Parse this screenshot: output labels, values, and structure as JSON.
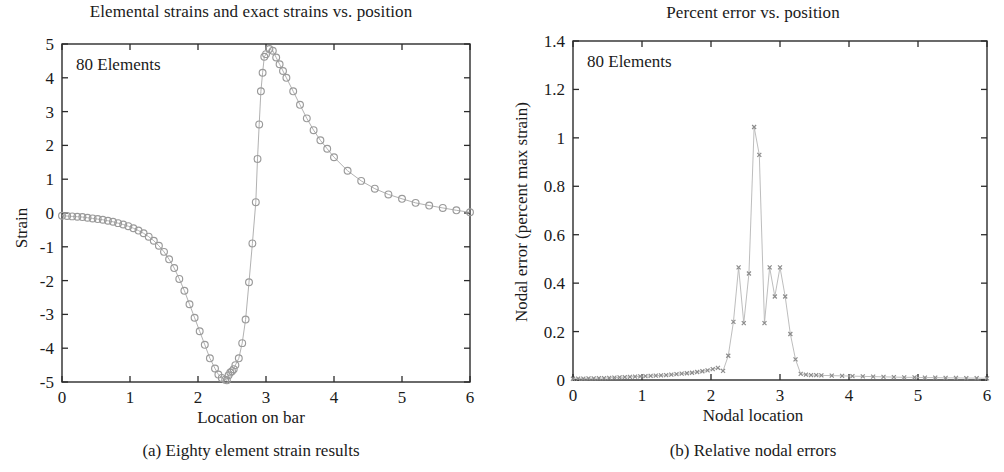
{
  "figure": {
    "panels": [
      {
        "id": "panel-a",
        "title": "Elemental strains and exact strains vs. position",
        "annotation": "80 Elements",
        "xlabel": "Location on bar",
        "ylabel": "Strain",
        "subcaption": "(a) Eighty element strain results"
      },
      {
        "id": "panel-b",
        "title": "Percent error vs. position",
        "annotation": "80 Elements",
        "xlabel": "Nodal location",
        "ylabel": "Nodal error (percent max strain)",
        "subcaption": "(b) Relative nodal errors"
      }
    ]
  },
  "chart_data": [
    {
      "type": "line",
      "title": "Elemental strains and exact strains vs. position",
      "annotation": "80 Elements",
      "xlabel": "Location on bar",
      "ylabel": "Strain",
      "xlim": [
        0,
        6
      ],
      "ylim": [
        -5,
        5
      ],
      "xticks": [
        0,
        1,
        2,
        3,
        4,
        5,
        6
      ],
      "yticks": [
        -5,
        -4,
        -3,
        -2,
        -1,
        0,
        1,
        2,
        3,
        4,
        5
      ],
      "xtick_labels": [
        "0",
        "1",
        "2",
        "3",
        "4",
        "5",
        "6"
      ],
      "ytick_labels": [
        "-5",
        "-4",
        "-3",
        "-2",
        "-1",
        "0",
        "1",
        "2",
        "3",
        "4",
        "5"
      ],
      "grid": false,
      "legend": "none",
      "marker": "circle",
      "marker_color": "#9a9a9a",
      "line_color": "#a8a8a8",
      "series": [
        {
          "name": "Elemental strain",
          "x": [
            0.0,
            0.075,
            0.15,
            0.225,
            0.3,
            0.375,
            0.45,
            0.525,
            0.6,
            0.675,
            0.75,
            0.825,
            0.9,
            0.975,
            1.05,
            1.125,
            1.2,
            1.275,
            1.35,
            1.425,
            1.5,
            1.575,
            1.65,
            1.725,
            1.8,
            1.875,
            1.95,
            2.025,
            2.1,
            2.175,
            2.25,
            2.3,
            2.35,
            2.4,
            2.425,
            2.45,
            2.475,
            2.5,
            2.525,
            2.55,
            2.6,
            2.65,
            2.7,
            2.75,
            2.8,
            2.85,
            2.875,
            2.9,
            2.925,
            2.95,
            2.975,
            3.0,
            3.05,
            3.1,
            3.15,
            3.2,
            3.25,
            3.3,
            3.4,
            3.5,
            3.6,
            3.7,
            3.8,
            3.9,
            4.0,
            4.2,
            4.4,
            4.6,
            4.8,
            5.0,
            5.2,
            5.4,
            5.6,
            5.8,
            6.0
          ],
          "y": [
            -0.08,
            -0.09,
            -0.1,
            -0.11,
            -0.12,
            -0.14,
            -0.16,
            -0.18,
            -0.2,
            -0.23,
            -0.26,
            -0.3,
            -0.34,
            -0.39,
            -0.45,
            -0.52,
            -0.6,
            -0.7,
            -0.82,
            -0.97,
            -1.15,
            -1.37,
            -1.63,
            -1.95,
            -2.3,
            -2.7,
            -3.1,
            -3.5,
            -3.9,
            -4.3,
            -4.6,
            -4.78,
            -4.88,
            -4.93,
            -4.95,
            -4.8,
            -4.72,
            -4.68,
            -4.62,
            -4.5,
            -4.3,
            -3.85,
            -3.15,
            -2.05,
            -0.9,
            0.32,
            1.6,
            2.62,
            3.6,
            4.15,
            4.62,
            4.7,
            4.85,
            4.8,
            4.6,
            4.4,
            4.2,
            4.0,
            3.6,
            3.2,
            2.8,
            2.45,
            2.15,
            1.9,
            1.65,
            1.25,
            0.95,
            0.72,
            0.55,
            0.42,
            0.3,
            0.22,
            0.15,
            0.08,
            0.02
          ]
        }
      ]
    },
    {
      "type": "line",
      "title": "Percent error vs. position",
      "annotation": "80 Elements",
      "xlabel": "Nodal location",
      "ylabel": "Nodal error (percent max strain)",
      "xlim": [
        0,
        6
      ],
      "ylim": [
        0,
        1.4
      ],
      "xticks": [
        0,
        1,
        2,
        3,
        4,
        5,
        6
      ],
      "yticks": [
        0,
        0.2,
        0.4,
        0.6,
        0.8,
        1.0,
        1.2,
        1.4
      ],
      "xtick_labels": [
        "0",
        "1",
        "2",
        "3",
        "4",
        "5",
        "6"
      ],
      "ytick_labels": [
        "0",
        "0.2",
        "0.4",
        "0.6",
        "0.8",
        "1",
        "1.2",
        "1.4"
      ],
      "grid": false,
      "legend": "none",
      "marker": "x",
      "marker_color": "#8c8c8c",
      "line_color": "#b5b5b5",
      "series": [
        {
          "name": "Nodal error",
          "x": [
            0.0,
            0.075,
            0.15,
            0.225,
            0.3,
            0.375,
            0.45,
            0.525,
            0.6,
            0.675,
            0.75,
            0.825,
            0.9,
            0.975,
            1.05,
            1.125,
            1.2,
            1.275,
            1.35,
            1.425,
            1.5,
            1.575,
            1.65,
            1.725,
            1.8,
            1.875,
            1.95,
            2.025,
            2.1,
            2.175,
            2.25,
            2.325,
            2.4,
            2.475,
            2.55,
            2.625,
            2.7,
            2.775,
            2.85,
            2.925,
            3.0,
            3.075,
            3.15,
            3.225,
            3.3,
            3.375,
            3.45,
            3.525,
            3.6,
            3.75,
            3.9,
            4.05,
            4.2,
            4.35,
            4.5,
            4.65,
            4.8,
            4.95,
            5.1,
            5.25,
            5.4,
            5.55,
            5.7,
            5.85,
            6.0
          ],
          "y": [
            0.005,
            0.006,
            0.006,
            0.007,
            0.007,
            0.008,
            0.008,
            0.009,
            0.01,
            0.011,
            0.012,
            0.013,
            0.014,
            0.015,
            0.016,
            0.017,
            0.018,
            0.019,
            0.02,
            0.022,
            0.024,
            0.026,
            0.028,
            0.03,
            0.033,
            0.036,
            0.04,
            0.045,
            0.05,
            0.038,
            0.1,
            0.24,
            0.465,
            0.235,
            0.44,
            1.045,
            0.93,
            0.235,
            0.465,
            0.345,
            0.465,
            0.345,
            0.19,
            0.085,
            0.025,
            0.022,
            0.02,
            0.02,
            0.019,
            0.018,
            0.017,
            0.016,
            0.015,
            0.014,
            0.013,
            0.012,
            0.011,
            0.011,
            0.01,
            0.01,
            0.009,
            0.009,
            0.008,
            0.008,
            0.007
          ]
        }
      ]
    }
  ]
}
